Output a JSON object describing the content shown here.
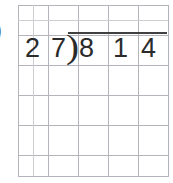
{
  "page": {
    "background_color": "#ffffff",
    "width": 173,
    "height": 183
  },
  "grid": {
    "name": "graph-paper",
    "major_line_color": "#b4b4ba",
    "minor_line_color": "#cdcdd2",
    "major_cell_px": 30,
    "minor_cell_px": 15,
    "left": 18,
    "top": 5,
    "width": 150,
    "height": 171
  },
  "left_marker": {
    "glyph": ")",
    "note": "partially cropped closing parenthesis at the far-left edge"
  },
  "problem": {
    "type": "long-division",
    "divisor_digits": [
      "2",
      "7"
    ],
    "bracket_glyph": ")",
    "dividend_digits": [
      "8",
      "1",
      "4"
    ],
    "divisor": "27",
    "dividend": "814",
    "expression": "814 ÷ 27",
    "digit_color": "#2b2b2b",
    "vinculum_color": "#404040",
    "quotient_digits": []
  }
}
